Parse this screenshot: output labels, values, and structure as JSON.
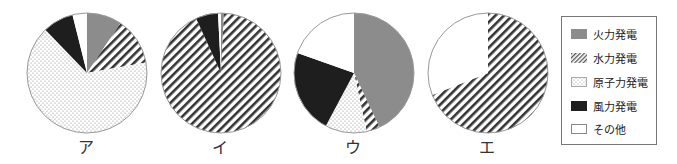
{
  "chart_data": {
    "type": "pie",
    "title": "",
    "categories": [
      "火力発電",
      "水力発電",
      "原子力発電",
      "風力発電",
      "その他"
    ],
    "charts": [
      {
        "label": "ア",
        "values": [
          9.4,
          12.8,
          65.6,
          8.3,
          3.9
        ]
      },
      {
        "label": "イ",
        "values": [
          0.8,
          92.4,
          0.0,
          6.0,
          0.8
        ]
      },
      {
        "label": "ウ",
        "values": [
          43.0,
          3.6,
          11.2,
          22.6,
          19.6
        ]
      },
      {
        "label": "エ",
        "values": [
          0.0,
          69.0,
          0.0,
          0.0,
          31.0
        ]
      }
    ],
    "start_angle": "top",
    "direction": "clockwise",
    "legend_position": "right"
  },
  "legend": {
    "items": [
      {
        "label": "火力発電",
        "pattern": "gray"
      },
      {
        "label": "水力発電",
        "pattern": "hatch"
      },
      {
        "label": "原子力発電",
        "pattern": "dots"
      },
      {
        "label": "風力発電",
        "pattern": "black"
      },
      {
        "label": "その他",
        "pattern": "white"
      }
    ]
  },
  "colors": {
    "gray": "#8c8c8c",
    "hatch_line": "#333333",
    "dots": "#9a9a9a",
    "black": "#1e1e1e",
    "white": "#ffffff",
    "outline": "#999999"
  }
}
